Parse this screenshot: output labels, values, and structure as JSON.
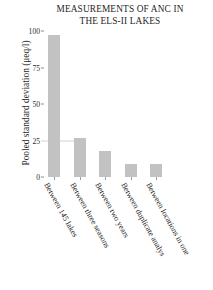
{
  "chart_data": {
    "type": "bar",
    "title": "MEASUREMENTS OF ANC IN THE ELS-II LAKES",
    "title_lines": [
      "MEASUREMENTS OF ANC IN",
      "THE ELS-II LAKES"
    ],
    "xlabel": "",
    "ylabel": "Pooled standard deviation (μeq/l)",
    "categories": [
      "Between 145 lakes",
      "Between three seasons",
      "Between two years",
      "Between duplicate analys",
      "Between locations in one"
    ],
    "values": [
      97,
      27,
      18,
      9,
      9
    ],
    "ylim": [
      0,
      100
    ],
    "yticks": [
      0,
      25,
      50,
      75,
      100
    ],
    "ytick_labels": [
      "0",
      "25",
      "50",
      "75",
      "100"
    ],
    "grid": false,
    "legend": null,
    "bar_color": "#c2c2c2",
    "background_color": "#ffffff",
    "text_color": "#1f1f1f"
  }
}
